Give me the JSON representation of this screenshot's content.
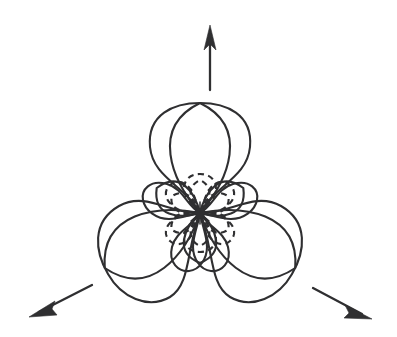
{
  "figure": {
    "background_color": "#ffffff",
    "stroke_color": "#2f2f31",
    "width": 397,
    "height": 337,
    "origin": {
      "x": 200,
      "y": 213
    }
  },
  "chart_data": {
    "type": "line",
    "subtitle": "",
    "xlabel": "",
    "ylabel": "",
    "coordinate_system": "polar",
    "grid": false,
    "legend": false,
    "axis_shown": false,
    "angle_units": "degrees",
    "radius_units": "pixels",
    "series": [
      {
        "name": "major-lobes",
        "style": "solid",
        "lobe_count": 3,
        "lobe_length": 110,
        "lobe_width": 96,
        "angles": [
          90,
          210,
          330
        ],
        "values": [
          110,
          110,
          110
        ]
      },
      {
        "name": "minor-lobes",
        "style": "solid",
        "lobe_count": 3,
        "lobe_length": 50,
        "lobe_width": 52,
        "angles": [
          30,
          150,
          270
        ],
        "values": [
          50,
          50,
          50
        ]
      },
      {
        "name": "dashed-lobes",
        "style": "dashed",
        "lobe_count": 6,
        "lobe_length": 33,
        "lobe_width": 30,
        "angles": [
          30,
          90,
          150,
          210,
          270,
          330
        ],
        "values": [
          33,
          33,
          33,
          33,
          33,
          33
        ]
      }
    ],
    "annotations": [
      {
        "name": "arrow-up",
        "label": "",
        "angle": 90,
        "tail": {
          "x": 210,
          "y": 90
        },
        "tip": {
          "x": 210,
          "y": 27
        }
      },
      {
        "name": "arrow-down-left",
        "label": "",
        "angle": 210,
        "tail": {
          "x": 92,
          "y": 285
        },
        "tip": {
          "x": 31,
          "y": 316
        }
      },
      {
        "name": "arrow-down-right",
        "label": "",
        "angle": 330,
        "tail": {
          "x": 313,
          "y": 288
        },
        "tip": {
          "x": 370,
          "y": 318
        }
      }
    ]
  }
}
